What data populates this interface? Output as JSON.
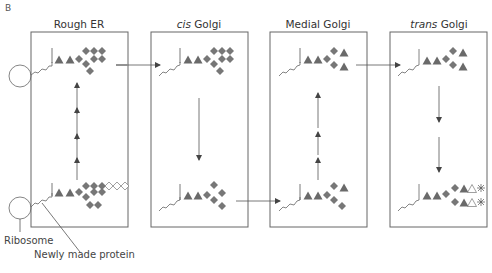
{
  "panel_letter": "B",
  "compartments": [
    {
      "id": "rough-er",
      "label": "Rough ER",
      "italic_prefix": ""
    },
    {
      "id": "cis-golgi",
      "label": "Golgi",
      "italic_prefix": "cis"
    },
    {
      "id": "medial-golgi",
      "label": "Medial Golgi",
      "italic_prefix": ""
    },
    {
      "id": "trans-golgi",
      "label": "Golgi",
      "italic_prefix": "trans"
    }
  ],
  "labels": {
    "ribosome": "Ribosome",
    "newly_made_protein": "Newly made protein"
  },
  "colors": {
    "box_stroke": "#666666",
    "sugar_fill": "#6a6a6a",
    "open_sugar": "#ffffff",
    "text": "#444444"
  },
  "legend_glyphs": {
    "filled_triangle": "N-acetylglucosamine-like residue (filled triangle)",
    "filled_diamond": "mannose-like residue (filled diamond)",
    "open_diamond": "glucose-like residue (open diamond)",
    "open_triangle": "open triangle",
    "asterisk": "terminal modification (asterisk)"
  }
}
